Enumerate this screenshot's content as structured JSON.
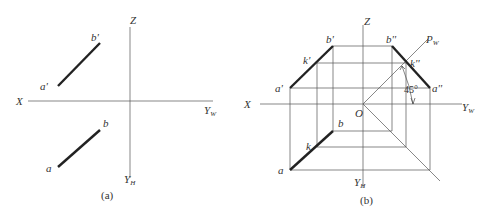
{
  "figure_a": {
    "caption": "(a)",
    "axes": {
      "x_label": "X",
      "z_label": "Z",
      "yw_label": "Y",
      "yw_sub": "W",
      "yh_label": "Y",
      "yh_sub": "H"
    },
    "points": {
      "a_prime": "a'",
      "b_prime": "b'",
      "a": "a",
      "b": "b"
    }
  },
  "figure_b": {
    "caption": "(b)",
    "axes": {
      "x_label": "X",
      "z_label": "Z",
      "yw_label": "Y",
      "yw_sub": "W",
      "yh_label": "Y",
      "yh_sub": "H",
      "origin": "O",
      "pw_label": "P",
      "pw_sub": "W"
    },
    "points": {
      "a_prime": "a'",
      "b_prime": "b'",
      "k_prime": "k'",
      "a": "a",
      "b": "b",
      "k": "k",
      "a_dbl": "a''",
      "b_dbl": "b''",
      "k_dbl": "k''"
    },
    "angle": "45°"
  }
}
